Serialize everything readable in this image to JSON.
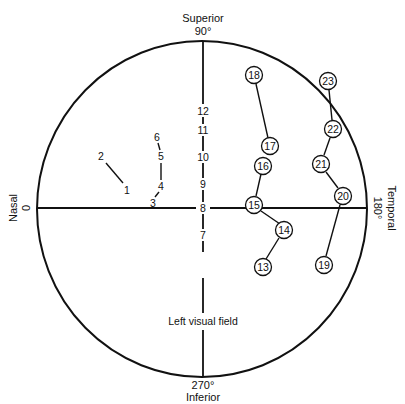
{
  "diagram": {
    "title": "Left visual field",
    "colors": {
      "ink": "#111111",
      "background": "#ffffff"
    },
    "axes": {
      "top": {
        "name": "Superior",
        "degree": "90°"
      },
      "bottom": {
        "degree": "270°",
        "name": "Inferior"
      },
      "left": {
        "name": "Nasal",
        "degree": "0"
      },
      "right": {
        "degree": "180°",
        "name": "Temporal"
      }
    },
    "plain_points": [
      {
        "label": "1",
        "x": 127,
        "y": 190
      },
      {
        "label": "2",
        "x": 101,
        "y": 156
      },
      {
        "label": "3",
        "x": 153,
        "y": 204
      },
      {
        "label": "4",
        "x": 161,
        "y": 186
      },
      {
        "label": "5",
        "x": 161,
        "y": 156
      },
      {
        "label": "6",
        "x": 157,
        "y": 137
      },
      {
        "label": "7",
        "x": 203,
        "y": 235
      },
      {
        "label": "8",
        "x": 203,
        "y": 208
      },
      {
        "label": "9",
        "x": 203,
        "y": 184
      },
      {
        "label": "10",
        "x": 203,
        "y": 157
      },
      {
        "label": "11",
        "x": 203,
        "y": 130
      },
      {
        "label": "12",
        "x": 203,
        "y": 111
      }
    ],
    "circled_points": [
      {
        "label": "13",
        "x": 263,
        "y": 267
      },
      {
        "label": "14",
        "x": 284,
        "y": 230
      },
      {
        "label": "15",
        "x": 254,
        "y": 205
      },
      {
        "label": "16",
        "x": 263,
        "y": 166
      },
      {
        "label": "17",
        "x": 270,
        "y": 146
      },
      {
        "label": "18",
        "x": 254,
        "y": 75
      },
      {
        "label": "19",
        "x": 324,
        "y": 265
      },
      {
        "label": "20",
        "x": 343,
        "y": 196
      },
      {
        "label": "21",
        "x": 321,
        "y": 164
      },
      {
        "label": "22",
        "x": 333,
        "y": 129
      },
      {
        "label": "23",
        "x": 328,
        "y": 81
      }
    ],
    "connections": [
      [
        "2",
        "1"
      ],
      [
        "3",
        "4"
      ],
      [
        "4",
        "5"
      ],
      [
        "5",
        "6"
      ],
      [
        "13",
        "14"
      ],
      [
        "14",
        "15"
      ],
      [
        "15",
        "16"
      ],
      [
        "17",
        "18"
      ],
      [
        "19",
        "20"
      ],
      [
        "20",
        "21"
      ],
      [
        "21",
        "22"
      ],
      [
        "22",
        "23"
      ]
    ]
  }
}
